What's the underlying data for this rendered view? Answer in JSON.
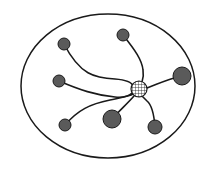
{
  "diagram": {
    "type": "hub-and-spoke network",
    "width": 217,
    "height": 171,
    "colors": {
      "background": "#ffffff",
      "stroke": "#1a1a1a",
      "node_fill": "#5a5a5a",
      "hub_fill": "#ffffff"
    },
    "boundary": {
      "shape": "ellipse",
      "cx": 108,
      "cy": 86,
      "rx": 87,
      "ry": 72
    },
    "hub": {
      "id": "hub",
      "cx": 139,
      "cy": 89,
      "r": 8,
      "pattern": "grid"
    },
    "nodes": [
      {
        "id": "node-top-left",
        "cx": 64,
        "cy": 44,
        "r": 6,
        "path": "M64,44 C80,75 95,78 115,79 C128,80 132,83 133,86"
      },
      {
        "id": "node-top",
        "cx": 123,
        "cy": 35,
        "r": 6,
        "path": "M123,35 C135,50 142,60 143,70 C144,76 143,79 142,82"
      },
      {
        "id": "node-left",
        "cx": 59,
        "cy": 81,
        "r": 6,
        "path": "M59,81 C80,90 95,95 115,97 C125,98 130,95 132,93"
      },
      {
        "id": "node-right",
        "cx": 182,
        "cy": 76,
        "r": 9,
        "path": "M182,76 C165,80 158,84 147,88"
      },
      {
        "id": "node-bottom-left",
        "cx": 65,
        "cy": 125,
        "r": 6,
        "path": "M65,125 C78,110 90,104 110,100 C124,97 130,96 133,94"
      },
      {
        "id": "node-bottom-center",
        "cx": 112,
        "cy": 119,
        "r": 9,
        "path": "M112,119 C120,110 127,104 134,96"
      },
      {
        "id": "node-bottom-right",
        "cx": 155,
        "cy": 127,
        "r": 7,
        "path": "M155,127 C154,114 152,105 147,101 C144,98 143,97 142,96"
      }
    ]
  }
}
